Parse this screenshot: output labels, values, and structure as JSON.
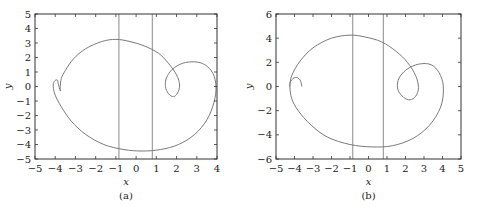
{
  "chart_data": [
    {
      "type": "line",
      "panel_label": "(a)",
      "xlabel": "x",
      "ylabel": "y",
      "xlim": [
        -5,
        4
      ],
      "ylim": [
        -5,
        5
      ],
      "xticks": [
        -5,
        -4,
        -3,
        -2,
        -1,
        0,
        1,
        2,
        3,
        4
      ],
      "yticks": [
        -5,
        -4,
        -3,
        -2,
        -1,
        0,
        1,
        2,
        3,
        4,
        5
      ],
      "grid": false,
      "vertical_lines": [
        -0.85,
        0.8
      ],
      "series": [
        {
          "name": "trajectory",
          "points": [
            [
              -3.75,
              0.0
            ],
            [
              -3.75,
              -0.3
            ],
            [
              -3.85,
              0.2
            ],
            [
              -3.9,
              0.45
            ],
            [
              -4.05,
              0.35
            ],
            [
              -4.1,
              0.0
            ],
            [
              -4.0,
              -0.6
            ],
            [
              -3.7,
              -1.4
            ],
            [
              -3.2,
              -2.4
            ],
            [
              -2.5,
              -3.3
            ],
            [
              -1.6,
              -4.0
            ],
            [
              -0.6,
              -4.35
            ],
            [
              0.3,
              -4.45
            ],
            [
              1.2,
              -4.35
            ],
            [
              2.1,
              -4.0
            ],
            [
              2.9,
              -3.3
            ],
            [
              3.5,
              -2.3
            ],
            [
              3.85,
              -1.1
            ],
            [
              3.95,
              0.0
            ],
            [
              3.8,
              0.9
            ],
            [
              3.4,
              1.5
            ],
            [
              2.9,
              1.7
            ],
            [
              2.3,
              1.6
            ],
            [
              1.8,
              1.2
            ],
            [
              1.5,
              0.6
            ],
            [
              1.45,
              0.0
            ],
            [
              1.6,
              -0.5
            ],
            [
              1.85,
              -0.7
            ],
            [
              2.05,
              -0.45
            ],
            [
              2.15,
              0.1
            ],
            [
              2.0,
              0.8
            ],
            [
              1.6,
              1.6
            ],
            [
              1.1,
              2.3
            ],
            [
              0.4,
              2.8
            ],
            [
              -0.3,
              3.1
            ],
            [
              -1.0,
              3.25
            ],
            [
              -1.7,
              3.1
            ],
            [
              -2.5,
              2.6
            ],
            [
              -3.1,
              1.9
            ],
            [
              -3.5,
              1.1
            ],
            [
              -3.7,
              0.55
            ],
            [
              -3.75,
              0.0
            ]
          ]
        }
      ]
    },
    {
      "type": "line",
      "panel_label": "(b)",
      "xlabel": "x",
      "ylabel": "y",
      "xlim": [
        -5,
        5
      ],
      "ylim": [
        -6,
        6
      ],
      "xticks": [
        -5,
        -4,
        -3,
        -2,
        -1,
        0,
        1,
        2,
        3,
        4,
        5
      ],
      "yticks": [
        -6,
        -4,
        -2,
        0,
        2,
        4,
        6
      ],
      "grid": false,
      "vertical_lines": [
        -0.85,
        0.8
      ],
      "series": [
        {
          "name": "trajectory",
          "points": [
            [
              -3.6,
              0.0
            ],
            [
              -3.7,
              0.55
            ],
            [
              -3.95,
              0.75
            ],
            [
              -4.2,
              0.45
            ],
            [
              -4.25,
              0.0
            ],
            [
              -4.15,
              -1.0
            ],
            [
              -3.8,
              -2.0
            ],
            [
              -3.1,
              -3.2
            ],
            [
              -2.2,
              -4.2
            ],
            [
              -1.0,
              -4.8
            ],
            [
              0.2,
              -5.0
            ],
            [
              1.3,
              -4.9
            ],
            [
              2.4,
              -4.3
            ],
            [
              3.3,
              -3.2
            ],
            [
              3.9,
              -1.7
            ],
            [
              4.05,
              -0.2
            ],
            [
              3.9,
              0.9
            ],
            [
              3.5,
              1.7
            ],
            [
              3.0,
              1.9
            ],
            [
              2.4,
              1.7
            ],
            [
              1.9,
              1.2
            ],
            [
              1.6,
              0.5
            ],
            [
              1.6,
              -0.3
            ],
            [
              1.9,
              -0.9
            ],
            [
              2.25,
              -1.1
            ],
            [
              2.55,
              -0.8
            ],
            [
              2.7,
              -0.1
            ],
            [
              2.55,
              0.9
            ],
            [
              2.1,
              2.0
            ],
            [
              1.5,
              2.9
            ],
            [
              0.7,
              3.7
            ],
            [
              -0.2,
              4.1
            ],
            [
              -1.0,
              4.25
            ],
            [
              -2.0,
              4.0
            ],
            [
              -3.0,
              3.2
            ],
            [
              -3.7,
              2.1
            ],
            [
              -4.15,
              0.9
            ],
            [
              -4.25,
              0.0
            ]
          ]
        }
      ]
    }
  ],
  "panels": {
    "a": {
      "caption": "(a)",
      "xlabel": "x",
      "ylabel": "y"
    },
    "b": {
      "caption": "(b)",
      "xlabel": "x",
      "ylabel": "y"
    }
  },
  "colors": {
    "curve": "#7a7a7a",
    "vline": "#8a8a8a",
    "axes": "#333333"
  }
}
